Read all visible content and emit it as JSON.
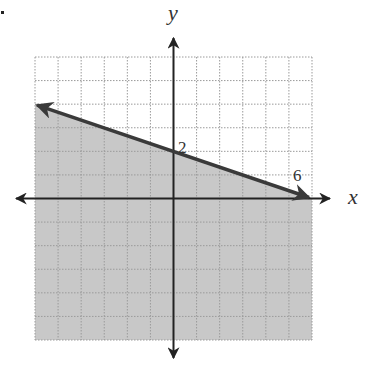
{
  "chart_data": {
    "type": "line",
    "title": "",
    "xlabel": "x",
    "ylabel": "y",
    "xlim": [
      -6,
      6
    ],
    "ylim": [
      -6,
      6
    ],
    "grid": true,
    "grid_style": "dotted",
    "boundary_line": {
      "equation": "y = -x/3 + 2",
      "style": "solid",
      "points": [
        {
          "x": -6,
          "y": 4
        },
        {
          "x": 6,
          "y": 0
        }
      ],
      "arrows": "both"
    },
    "shaded_region": "below line (y <= -x/3 + 2)",
    "annotations": [
      {
        "text": "2",
        "x": 0,
        "y": 2,
        "meaning": "y-intercept"
      },
      {
        "text": "6",
        "x": 6,
        "y": 0,
        "meaning": "x-intercept"
      }
    ],
    "colors": {
      "shade": "#c8c8c8",
      "grid": "#9a9a9a",
      "axis": "#222222",
      "line": "#3a3a3a"
    }
  },
  "labels": {
    "x_axis": "x",
    "y_axis": "y",
    "y_intercept": "2",
    "x_intercept": "6",
    "marker": "."
  }
}
